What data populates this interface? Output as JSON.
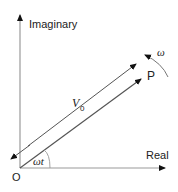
{
  "diagram": {
    "type": "phasor-diagram",
    "axes": {
      "vertical_label": "Imaginary",
      "horizontal_label": "Real",
      "origin_label": "O"
    },
    "phasor": {
      "tip_label": "P",
      "magnitude_label": "V",
      "magnitude_subscript": "0",
      "angle_label": "ωt",
      "rotation_label": "ω"
    },
    "colors": {
      "axis": "#9a9a9a",
      "phasor": "#444444",
      "arrowhead": "#111111",
      "text": "#222222"
    }
  }
}
